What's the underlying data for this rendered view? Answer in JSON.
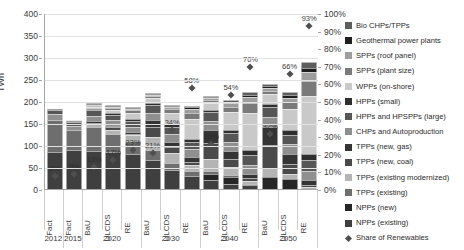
{
  "chart_data": {
    "type": "bar",
    "title": "",
    "ylabel": "TWh",
    "ylabel_right": "",
    "xlabel": "",
    "ylim": [
      0,
      400
    ],
    "ylim_right": [
      0,
      100
    ],
    "grid": true,
    "legend_position": "right",
    "y_ticks": [
      "400",
      "350",
      "300",
      "250",
      "200",
      "150",
      "100",
      "50",
      "0"
    ],
    "y_ticks_right": [
      "100%",
      "90%",
      "80%",
      "70%",
      "60%",
      "50%",
      "40%",
      "30%",
      "20%",
      "10%",
      "0%"
    ],
    "categories": [
      "Fact",
      "Fact",
      "BaU",
      "ULCDS",
      "RE",
      "BaU",
      "ULCDS",
      "RE",
      "BaU",
      "ULCDS",
      "RE",
      "BaU",
      "ULCDS",
      "RE"
    ],
    "group_labels": [
      "2012",
      "2015",
      "2020",
      "2030",
      "2040",
      "2050"
    ],
    "group_spans": [
      1,
      1,
      3,
      3,
      3,
      3
    ],
    "series": [
      {
        "name": "NPPs (existing)",
        "color": "#3f3f3f",
        "values": [
          84,
          88,
          87,
          84,
          80,
          66,
          44,
          30,
          20,
          12,
          8,
          0,
          0,
          0
        ]
      },
      {
        "name": "NPPs (new)",
        "color": "#262626",
        "values": [
          0,
          0,
          0,
          0,
          0,
          0,
          0,
          0,
          14,
          16,
          0,
          28,
          22,
          0
        ]
      },
      {
        "name": "TPPs (existing)",
        "color": "#6e6e6e",
        "values": [
          72,
          46,
          54,
          40,
          30,
          22,
          14,
          10,
          8,
          5,
          3,
          0,
          0,
          0
        ]
      },
      {
        "name": "TPPs (existing modernized)",
        "color": "#b4b4b4",
        "values": [
          0,
          0,
          6,
          10,
          12,
          30,
          24,
          14,
          26,
          18,
          8,
          20,
          12,
          4
        ]
      },
      {
        "name": "TPPs (new, coal)",
        "color": "#4a4a4a",
        "values": [
          0,
          0,
          4,
          6,
          4,
          22,
          14,
          8,
          36,
          18,
          6,
          52,
          22,
          6
        ]
      },
      {
        "name": "TPPs (new, gas)",
        "color": "#353535",
        "values": [
          0,
          0,
          4,
          4,
          4,
          16,
          12,
          10,
          30,
          18,
          10,
          42,
          24,
          10
        ]
      },
      {
        "name": "CHPs and Autoproduction",
        "color": "#8f8f8f",
        "values": [
          14,
          10,
          12,
          12,
          12,
          18,
          18,
          18,
          20,
          20,
          20,
          22,
          22,
          22
        ]
      },
      {
        "name": "HPPs and HPSPPs (large)",
        "color": "#565656",
        "values": [
          10,
          9,
          12,
          12,
          12,
          16,
          16,
          16,
          20,
          20,
          22,
          22,
          22,
          24
        ]
      },
      {
        "name": "HPPs (small)",
        "color": "#2f2f2f",
        "values": [
          2,
          2,
          3,
          4,
          5,
          5,
          6,
          8,
          6,
          8,
          12,
          8,
          10,
          14
        ]
      },
      {
        "name": "WPPs (on-shore)",
        "color": "#c9c9c9",
        "values": [
          0,
          1,
          4,
          8,
          14,
          12,
          26,
          46,
          16,
          40,
          84,
          22,
          48,
          132
        ]
      },
      {
        "name": "SPPs (plant size)",
        "color": "#7a7a7a",
        "values": [
          0,
          0,
          2,
          4,
          6,
          4,
          8,
          14,
          6,
          12,
          22,
          8,
          16,
          34
        ]
      },
      {
        "name": "SPPs (roof panel)",
        "color": "#9e9e9e",
        "values": [
          0,
          0,
          1,
          2,
          3,
          2,
          4,
          8,
          4,
          8,
          14,
          6,
          10,
          20
        ]
      },
      {
        "name": "Geothermal power plants",
        "color": "#1f1f1f",
        "values": [
          0,
          0,
          1,
          1,
          2,
          2,
          3,
          4,
          2,
          4,
          6,
          4,
          6,
          10
        ]
      },
      {
        "name": "Bio CHPs/TPPs",
        "color": "#5e5e5e",
        "values": [
          0,
          0,
          1,
          1,
          2,
          2,
          3,
          4,
          2,
          4,
          6,
          4,
          6,
          12
        ]
      }
    ],
    "totals": [
      182,
      156,
      191,
      188,
      186,
      217,
      192,
      190,
      210,
      203,
      221,
      238,
      220,
      288
    ],
    "share_of_renewables": {
      "name": "Share of Renewables",
      "unit": "%",
      "values": [
        8,
        9,
        13,
        17,
        23,
        21,
        34,
        58,
        26,
        54,
        70,
        32,
        66,
        93
      ],
      "labels": [
        "8%",
        "9%",
        "13%",
        "17%",
        "23%",
        "21%",
        "34%",
        "58%",
        "26%",
        "54%",
        "70%",
        "32%",
        "66%",
        "93%"
      ]
    }
  },
  "legend": {
    "items": [
      {
        "label": "Bio CHPs/TPPs",
        "color": "#5e5e5e",
        "icon": "square-swatch"
      },
      {
        "label": "Geothermal power plants",
        "color": "#1f1f1f",
        "icon": "square-swatch"
      },
      {
        "label": "SPPs (roof panel)",
        "color": "#9e9e9e",
        "icon": "square-swatch"
      },
      {
        "label": "SPPs (plant size)",
        "color": "#7a7a7a",
        "icon": "square-swatch"
      },
      {
        "label": "WPPs (on-shore)",
        "color": "#c9c9c9",
        "icon": "square-swatch"
      },
      {
        "label": "HPPs (small)",
        "color": "#2f2f2f",
        "icon": "square-swatch"
      },
      {
        "label": "HPPs and HPSPPs (large)",
        "color": "#565656",
        "icon": "square-swatch"
      },
      {
        "label": "CHPs and Autoproduction",
        "color": "#8f8f8f",
        "icon": "square-swatch"
      },
      {
        "label": "TPPs (new, gas)",
        "color": "#353535",
        "icon": "square-swatch"
      },
      {
        "label": "TPPs (new, coal)",
        "color": "#4a4a4a",
        "icon": "square-swatch"
      },
      {
        "label": "TPPs (existing modernized)",
        "color": "#b4b4b4",
        "icon": "square-swatch"
      },
      {
        "label": "TPPs (existing)",
        "color": "#6e6e6e",
        "icon": "square-swatch"
      },
      {
        "label": "NPPs (new)",
        "color": "#262626",
        "icon": "square-swatch"
      },
      {
        "label": "NPPs (existing)",
        "color": "#3f3f3f",
        "icon": "square-swatch"
      },
      {
        "label": "Share of Renewables",
        "color": "#4f4f4f",
        "icon": "diamond-marker"
      }
    ]
  }
}
